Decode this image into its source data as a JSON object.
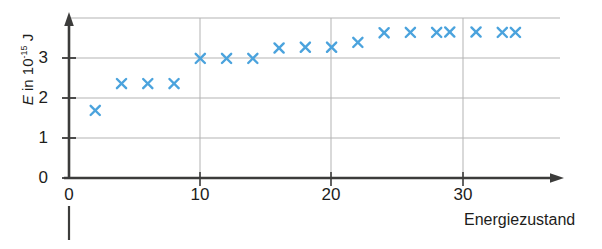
{
  "chart_data": {
    "type": "scatter",
    "title": "",
    "xlabel": "Energiezustand",
    "ylabel": "E in 10^-15 J",
    "ylabel_symbol": "E",
    "ylabel_prefix": " in 10",
    "ylabel_exponent": "-15",
    "ylabel_unit": " J",
    "xlim": [
      0,
      36
    ],
    "ylim": [
      0,
      3.95
    ],
    "xticks": [
      0,
      10,
      20,
      30
    ],
    "yticks": [
      0,
      1,
      2,
      3
    ],
    "xtick_labels": [
      "0",
      "10",
      "20",
      "30"
    ],
    "ytick_labels": [
      "0",
      "1",
      "2",
      "3"
    ],
    "grid": "horizontal-and-vertical-at-ticks",
    "legend": "none",
    "marker": "x",
    "marker_color": "#4ba3dd",
    "axis_color": "#3c3c3b",
    "grid_color": "#b3b3b3",
    "x": [
      2,
      4,
      6,
      8,
      10,
      12,
      14,
      16,
      18,
      20,
      22,
      24,
      26,
      28,
      29,
      31,
      33,
      34
    ],
    "y": [
      1.69,
      2.36,
      2.36,
      2.36,
      2.99,
      2.99,
      2.99,
      3.25,
      3.27,
      3.27,
      3.39,
      3.63,
      3.64,
      3.64,
      3.65,
      3.65,
      3.64,
      3.64
    ],
    "points": [
      {
        "x": 2,
        "y": 1.69
      },
      {
        "x": 4,
        "y": 2.36
      },
      {
        "x": 6,
        "y": 2.36
      },
      {
        "x": 8,
        "y": 2.36
      },
      {
        "x": 10,
        "y": 2.99
      },
      {
        "x": 12,
        "y": 2.99
      },
      {
        "x": 14,
        "y": 2.99
      },
      {
        "x": 16,
        "y": 3.25
      },
      {
        "x": 18,
        "y": 3.27
      },
      {
        "x": 20,
        "y": 3.27
      },
      {
        "x": 22,
        "y": 3.39
      },
      {
        "x": 24,
        "y": 3.63
      },
      {
        "x": 26,
        "y": 3.64
      },
      {
        "x": 28,
        "y": 3.64
      },
      {
        "x": 29,
        "y": 3.65
      },
      {
        "x": 31,
        "y": 3.65
      },
      {
        "x": 33,
        "y": 3.64
      },
      {
        "x": 34,
        "y": 3.64
      }
    ]
  }
}
